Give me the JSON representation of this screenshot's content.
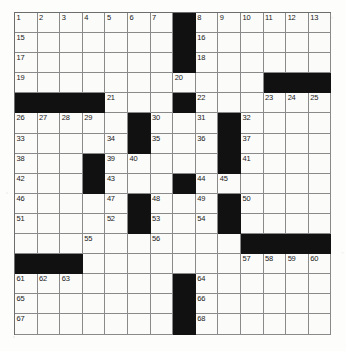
{
  "puzzle": {
    "kind": "crossword-grid",
    "title": "",
    "columns": 14,
    "rows": 16,
    "colors": {
      "block": "#111111",
      "cell": "#fbfbf9",
      "grid_line": "#8a8a8a",
      "border": "#6d6d6d",
      "number_text": "#1a1a1a"
    },
    "black_squares": [
      [
        0,
        7
      ],
      [
        1,
        7
      ],
      [
        2,
        7
      ],
      [
        3,
        11
      ],
      [
        3,
        12
      ],
      [
        3,
        13
      ],
      [
        4,
        0
      ],
      [
        4,
        1
      ],
      [
        4,
        2
      ],
      [
        4,
        3
      ],
      [
        4,
        7
      ],
      [
        5,
        5
      ],
      [
        5,
        9
      ],
      [
        6,
        5
      ],
      [
        6,
        9
      ],
      [
        7,
        3
      ],
      [
        7,
        9
      ],
      [
        8,
        3
      ],
      [
        8,
        7
      ],
      [
        9,
        5
      ],
      [
        9,
        9
      ],
      [
        10,
        5
      ],
      [
        10,
        9
      ],
      [
        11,
        10
      ],
      [
        11,
        11
      ],
      [
        11,
        12
      ],
      [
        11,
        13
      ],
      [
        12,
        0
      ],
      [
        12,
        1
      ],
      [
        12,
        2
      ],
      [
        13,
        7
      ],
      [
        14,
        7
      ],
      [
        15,
        7
      ]
    ],
    "numbered_cells": [
      {
        "n": 1,
        "row": 0,
        "col": 0
      },
      {
        "n": 2,
        "row": 0,
        "col": 1
      },
      {
        "n": 3,
        "row": 0,
        "col": 2
      },
      {
        "n": 4,
        "row": 0,
        "col": 3
      },
      {
        "n": 5,
        "row": 0,
        "col": 4
      },
      {
        "n": 6,
        "row": 0,
        "col": 5
      },
      {
        "n": 7,
        "row": 0,
        "col": 6
      },
      {
        "n": 8,
        "row": 0,
        "col": 8
      },
      {
        "n": 9,
        "row": 0,
        "col": 9
      },
      {
        "n": 10,
        "row": 0,
        "col": 10
      },
      {
        "n": 11,
        "row": 0,
        "col": 11
      },
      {
        "n": 12,
        "row": 0,
        "col": 12
      },
      {
        "n": 13,
        "row": 0,
        "col": 13
      },
      {
        "n": 14,
        "row": 0,
        "col": 13
      },
      {
        "n": 15,
        "row": 1,
        "col": 0
      },
      {
        "n": 16,
        "row": 1,
        "col": 8
      },
      {
        "n": 17,
        "row": 2,
        "col": 0
      },
      {
        "n": 18,
        "row": 2,
        "col": 8
      },
      {
        "n": 19,
        "row": 3,
        "col": 0
      },
      {
        "n": 20,
        "row": 3,
        "col": 7
      },
      {
        "n": 21,
        "row": 4,
        "col": 4
      },
      {
        "n": 22,
        "row": 4,
        "col": 8
      },
      {
        "n": 23,
        "row": 4,
        "col": 11
      },
      {
        "n": 24,
        "row": 4,
        "col": 12
      },
      {
        "n": 25,
        "row": 4,
        "col": 13
      },
      {
        "n": 26,
        "row": 5,
        "col": 0
      },
      {
        "n": 27,
        "row": 5,
        "col": 1
      },
      {
        "n": 28,
        "row": 5,
        "col": 2
      },
      {
        "n": 29,
        "row": 5,
        "col": 3
      },
      {
        "n": 30,
        "row": 5,
        "col": 6
      },
      {
        "n": 31,
        "row": 5,
        "col": 8
      },
      {
        "n": 32,
        "row": 5,
        "col": 10
      },
      {
        "n": 33,
        "row": 6,
        "col": 0
      },
      {
        "n": 34,
        "row": 6,
        "col": 4
      },
      {
        "n": 35,
        "row": 6,
        "col": 6
      },
      {
        "n": 36,
        "row": 6,
        "col": 8
      },
      {
        "n": 37,
        "row": 6,
        "col": 10
      },
      {
        "n": 38,
        "row": 7,
        "col": 0
      },
      {
        "n": 39,
        "row": 7,
        "col": 4
      },
      {
        "n": 40,
        "row": 7,
        "col": 5
      },
      {
        "n": 41,
        "row": 7,
        "col": 10
      },
      {
        "n": 42,
        "row": 8,
        "col": 0
      },
      {
        "n": 43,
        "row": 8,
        "col": 4
      },
      {
        "n": 44,
        "row": 8,
        "col": 8
      },
      {
        "n": 45,
        "row": 8,
        "col": 9
      },
      {
        "n": 46,
        "row": 9,
        "col": 0
      },
      {
        "n": 47,
        "row": 9,
        "col": 4
      },
      {
        "n": 48,
        "row": 9,
        "col": 6
      },
      {
        "n": 49,
        "row": 9,
        "col": 8
      },
      {
        "n": 50,
        "row": 9,
        "col": 10
      },
      {
        "n": 51,
        "row": 10,
        "col": 0
      },
      {
        "n": 52,
        "row": 10,
        "col": 4
      },
      {
        "n": 53,
        "row": 10,
        "col": 6
      },
      {
        "n": 54,
        "row": 10,
        "col": 8
      },
      {
        "n": 55,
        "row": 11,
        "col": 3
      },
      {
        "n": 56,
        "row": 11,
        "col": 6
      },
      {
        "n": 57,
        "row": 12,
        "col": 10
      },
      {
        "n": 58,
        "row": 12,
        "col": 11
      },
      {
        "n": 59,
        "row": 12,
        "col": 12
      },
      {
        "n": 60,
        "row": 12,
        "col": 13
      },
      {
        "n": 61,
        "row": 13,
        "col": 0
      },
      {
        "n": 62,
        "row": 13,
        "col": 1
      },
      {
        "n": 63,
        "row": 13,
        "col": 2
      },
      {
        "n": 64,
        "row": 13,
        "col": 8
      },
      {
        "n": 65,
        "row": 14,
        "col": 0
      },
      {
        "n": 66,
        "row": 14,
        "col": 8
      },
      {
        "n": 67,
        "row": 15,
        "col": 0
      },
      {
        "n": 68,
        "row": 15,
        "col": 8
      }
    ],
    "entered_letters": []
  }
}
